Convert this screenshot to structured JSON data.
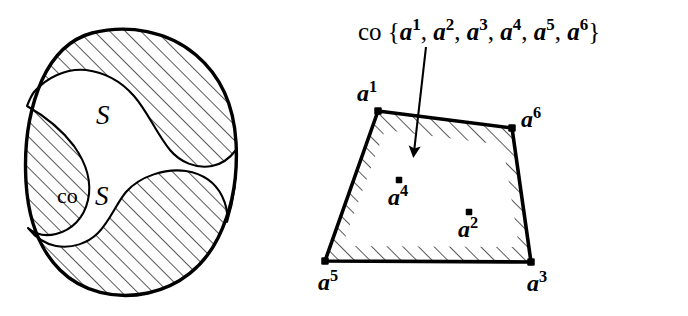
{
  "figure": {
    "background_color": "#ffffff",
    "ink_color": "#000000"
  },
  "left_panel": {
    "name": "non-convex-set-panel",
    "labels": {
      "set_label": "S",
      "hull_label_prefix": "co",
      "hull_label_set": "S"
    },
    "description_hatched": "hatched band between S and co S"
  },
  "right_panel": {
    "name": "convex-hull-of-points-panel",
    "caption": {
      "operator": "co",
      "open_brace": "{",
      "close_brace": "}",
      "separator": ",",
      "base": "a",
      "point_superscripts": [
        "1",
        "2",
        "3",
        "4",
        "5",
        "6"
      ],
      "full_text": "co {a1, a2, a3, a4, a5, a6}"
    },
    "vertices": [
      {
        "id": "a1",
        "base": "a",
        "sup": "1",
        "x": 378,
        "y": 111,
        "label_x": 357,
        "label_y": 101,
        "kind": "vertex"
      },
      {
        "id": "a6",
        "base": "a",
        "sup": "6",
        "x": 512,
        "y": 128,
        "label_x": 521,
        "label_y": 127,
        "kind": "vertex"
      },
      {
        "id": "a3",
        "base": "a",
        "sup": "3",
        "x": 531,
        "y": 262,
        "label_x": 527,
        "label_y": 291,
        "kind": "vertex"
      },
      {
        "id": "a5",
        "base": "a",
        "sup": "5",
        "x": 325,
        "y": 261,
        "label_x": 318,
        "label_y": 290,
        "kind": "vertex"
      }
    ],
    "interior_points": [
      {
        "id": "a4",
        "base": "a",
        "sup": "4",
        "x": 399,
        "y": 180,
        "label_x": 388,
        "label_y": 205,
        "kind": "interior"
      },
      {
        "id": "a2",
        "base": "a",
        "sup": "2",
        "x": 469,
        "y": 212,
        "label_x": 458,
        "label_y": 237,
        "kind": "interior"
      }
    ],
    "arrow": {
      "from_x": 426,
      "from_y": 47,
      "to_x": 414,
      "to_y": 152
    }
  }
}
